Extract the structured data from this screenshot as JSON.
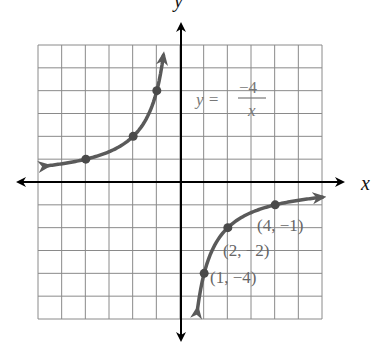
{
  "chart_data": {
    "type": "line",
    "title": "",
    "equation": {
      "lhs": "y",
      "eq": "=",
      "numerator": "−4",
      "denominator": "x"
    },
    "xlabel": "x",
    "ylabel": "y",
    "xlim": [
      -6,
      6
    ],
    "ylim": [
      -6,
      6
    ],
    "grid": true,
    "grid_step": 1,
    "series": [
      {
        "name": "branch-left",
        "function": "y = -4/x",
        "x": [
          -4,
          -2,
          -1
        ],
        "y": [
          1,
          2,
          4
        ],
        "arrows": "both"
      },
      {
        "name": "branch-right",
        "function": "y = -4/x",
        "x": [
          1,
          2,
          4
        ],
        "y": [
          -4,
          -2,
          -1
        ],
        "arrows": "both"
      }
    ],
    "annotations": [
      {
        "text": "(4, −1)",
        "x": 4,
        "y": -1
      },
      {
        "text": "(2, −2)",
        "x": 2,
        "y": -2
      },
      {
        "text": "(1, −4)",
        "x": 1,
        "y": -4
      }
    ]
  },
  "labels": {
    "x_axis": "x",
    "y_axis": "y",
    "eq_lhs": "y =",
    "eq_num": "−4",
    "eq_den": "x",
    "pt1": "(4, −1)",
    "pt2": "(2, −2)",
    "pt3": "(1, −4)"
  },
  "colors": {
    "grid": "#8a8a8a",
    "axis": "#000000",
    "curve": "#5a5a5a",
    "point_label": "#666666"
  }
}
